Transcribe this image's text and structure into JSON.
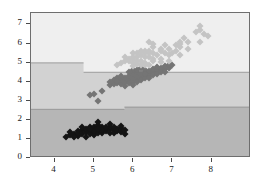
{
  "chart_data": {
    "type": "scatter",
    "title": "",
    "subtitle": "",
    "xlabel": "",
    "ylabel": "",
    "xlim": [
      3.4,
      9.0
    ],
    "ylim": [
      0,
      7.6
    ],
    "xticks": [
      4,
      5,
      6,
      7,
      8
    ],
    "yticks": [
      0,
      1,
      2,
      3,
      4,
      5,
      6,
      7
    ],
    "xtick_labels": [
      "4",
      "5",
      "6",
      "7",
      "8"
    ],
    "ytick_labels": [
      "0",
      "1",
      "2",
      "3",
      "4",
      "5",
      "6",
      "7"
    ],
    "grid": false,
    "legend": null,
    "legend_position": "none",
    "annotations": [],
    "background_regions": [
      {
        "name": "upper-region",
        "color": "#efefef",
        "label": "class-3",
        "boundary_low": 4.45,
        "boundary_high": 7.6,
        "step_x": 4.75,
        "step_boundary_low": 4.95
      },
      {
        "name": "middle-region",
        "color": "#d2d2d2",
        "label": "class-2",
        "boundary_low": 2.6,
        "boundary_high": 4.45,
        "step_x": 4.75,
        "step_boundary_high": 4.95
      },
      {
        "name": "lower-region",
        "color": "#b6b6b6",
        "label": "class-1",
        "boundary_low": 0,
        "boundary_high": 2.6,
        "step_x": 5.8,
        "step_boundary_high": 2.48
      }
    ],
    "series": [
      {
        "name": "cluster-1",
        "color": "#141414",
        "marker": "diamond",
        "points": [
          [
            4.3,
            1.1
          ],
          [
            4.4,
            1.2
          ],
          [
            4.4,
            1.35
          ],
          [
            4.5,
            1.25
          ],
          [
            4.6,
            1.4
          ],
          [
            4.6,
            1.15
          ],
          [
            4.6,
            1.3
          ],
          [
            4.7,
            1.45
          ],
          [
            4.7,
            1.25
          ],
          [
            4.8,
            1.1
          ],
          [
            4.8,
            1.35
          ],
          [
            4.8,
            1.5
          ],
          [
            4.9,
            1.4
          ],
          [
            4.9,
            1.25
          ],
          [
            4.9,
            1.6
          ],
          [
            5.0,
            1.5
          ],
          [
            5.0,
            1.3
          ],
          [
            5.0,
            1.65
          ],
          [
            5.0,
            1.2
          ],
          [
            5.1,
            1.45
          ],
          [
            5.1,
            1.6
          ],
          [
            5.1,
            1.3
          ],
          [
            5.1,
            1.75
          ],
          [
            5.1,
            1.9
          ],
          [
            5.2,
            1.5
          ],
          [
            5.2,
            1.3
          ],
          [
            5.2,
            1.6
          ],
          [
            5.3,
            1.4
          ],
          [
            5.3,
            1.55
          ],
          [
            5.4,
            1.5
          ],
          [
            5.4,
            1.65
          ],
          [
            5.4,
            1.3
          ],
          [
            5.4,
            1.8
          ],
          [
            5.5,
            1.45
          ],
          [
            5.5,
            1.6
          ],
          [
            5.5,
            1.3
          ],
          [
            5.6,
            1.5
          ],
          [
            5.6,
            1.4
          ],
          [
            5.7,
            1.35
          ],
          [
            5.7,
            1.55
          ],
          [
            5.7,
            1.7
          ],
          [
            5.8,
            1.25
          ],
          [
            5.8,
            1.45
          ],
          [
            4.5,
            1.1
          ],
          [
            4.7,
            1.6
          ],
          [
            5.0,
            1.4
          ],
          [
            5.2,
            1.45
          ],
          [
            5.3,
            1.65
          ],
          [
            5.1,
            1.5
          ],
          [
            4.9,
            1.5
          ]
        ]
      },
      {
        "name": "cluster-2",
        "color": "#757575",
        "marker": "diamond",
        "points": [
          [
            4.9,
            3.3
          ],
          [
            5.0,
            3.35
          ],
          [
            5.1,
            3.0
          ],
          [
            5.2,
            3.5
          ],
          [
            5.4,
            3.85
          ],
          [
            5.5,
            3.9
          ],
          [
            5.5,
            4.1
          ],
          [
            5.6,
            3.95
          ],
          [
            5.6,
            4.2
          ],
          [
            5.7,
            3.9
          ],
          [
            5.7,
            4.1
          ],
          [
            5.8,
            3.8
          ],
          [
            5.8,
            4.0
          ],
          [
            5.8,
            4.2
          ],
          [
            5.9,
            4.1
          ],
          [
            5.9,
            3.95
          ],
          [
            5.9,
            4.3
          ],
          [
            6.0,
            4.0
          ],
          [
            6.0,
            4.2
          ],
          [
            6.0,
            3.85
          ],
          [
            6.0,
            4.4
          ],
          [
            6.1,
            4.1
          ],
          [
            6.1,
            4.3
          ],
          [
            6.1,
            4.0
          ],
          [
            6.1,
            4.5
          ],
          [
            6.2,
            4.2
          ],
          [
            6.2,
            4.4
          ],
          [
            6.2,
            4.1
          ],
          [
            6.3,
            4.3
          ],
          [
            6.3,
            4.5
          ],
          [
            6.3,
            4.2
          ],
          [
            6.3,
            4.6
          ],
          [
            6.4,
            4.4
          ],
          [
            6.4,
            4.3
          ],
          [
            6.4,
            4.55
          ],
          [
            6.5,
            4.5
          ],
          [
            6.5,
            4.35
          ],
          [
            6.5,
            4.65
          ],
          [
            6.6,
            4.5
          ],
          [
            6.6,
            4.6
          ],
          [
            6.6,
            4.4
          ],
          [
            6.7,
            4.6
          ],
          [
            6.7,
            4.7
          ],
          [
            6.7,
            4.5
          ],
          [
            6.8,
            4.65
          ],
          [
            6.8,
            4.8
          ],
          [
            6.9,
            4.7
          ],
          [
            6.9,
            4.85
          ],
          [
            7.0,
            4.9
          ],
          [
            6.2,
            4.7
          ],
          [
            5.4,
            4.0
          ],
          [
            5.6,
            4.05
          ],
          [
            6.0,
            4.6
          ],
          [
            5.9,
            4.5
          ],
          [
            6.4,
            4.2
          ],
          [
            6.6,
            4.75
          ],
          [
            6.8,
            4.5
          ],
          [
            5.7,
            4.3
          ],
          [
            6.1,
            4.6
          ],
          [
            6.3,
            4.4
          ]
        ]
      },
      {
        "name": "cluster-3",
        "color": "#c4c4c4",
        "marker": "diamond",
        "points": [
          [
            5.6,
            4.9
          ],
          [
            5.7,
            5.0
          ],
          [
            5.8,
            5.1
          ],
          [
            5.8,
            5.3
          ],
          [
            5.9,
            5.1
          ],
          [
            6.0,
            4.8
          ],
          [
            6.0,
            5.0
          ],
          [
            6.0,
            5.2
          ],
          [
            6.1,
            5.1
          ],
          [
            6.1,
            5.3
          ],
          [
            6.2,
            5.4
          ],
          [
            6.2,
            5.1
          ],
          [
            6.3,
            5.0
          ],
          [
            6.3,
            5.3
          ],
          [
            6.3,
            5.6
          ],
          [
            6.3,
            5.5
          ],
          [
            6.4,
            5.3
          ],
          [
            6.4,
            5.5
          ],
          [
            6.4,
            5.6
          ],
          [
            6.5,
            5.5
          ],
          [
            6.5,
            5.2
          ],
          [
            6.5,
            5.8
          ],
          [
            6.5,
            5.1
          ],
          [
            6.6,
            5.4
          ],
          [
            6.7,
            5.7
          ],
          [
            6.7,
            5.2
          ],
          [
            6.7,
            5.6
          ],
          [
            6.8,
            5.5
          ],
          [
            6.9,
            5.4
          ],
          [
            6.9,
            5.7
          ],
          [
            7.0,
            5.5
          ],
          [
            7.1,
            5.9
          ],
          [
            7.2,
            6.0
          ],
          [
            7.2,
            5.8
          ],
          [
            7.2,
            6.1
          ],
          [
            7.3,
            6.3
          ],
          [
            7.4,
            6.1
          ],
          [
            7.6,
            6.6
          ],
          [
            7.7,
            6.7
          ],
          [
            7.7,
            6.1
          ],
          [
            7.7,
            6.9
          ],
          [
            7.9,
            6.4
          ],
          [
            6.2,
            4.85
          ],
          [
            6.4,
            4.9
          ],
          [
            6.1,
            4.95
          ],
          [
            6.7,
            5.05
          ],
          [
            7.4,
            5.7
          ],
          [
            6.8,
            5.9
          ],
          [
            6.0,
            5.5
          ],
          [
            6.9,
            5.1
          ],
          [
            5.9,
            5.2
          ],
          [
            6.3,
            4.9
          ],
          [
            7.1,
            5.6
          ],
          [
            7.2,
            5.4
          ],
          [
            6.5,
            6.0
          ],
          [
            6.4,
            6.1
          ],
          [
            6.2,
            5.6
          ],
          [
            6.1,
            5.5
          ],
          [
            6.0,
            5.3
          ],
          [
            7.8,
            6.5
          ]
        ]
      }
    ]
  }
}
